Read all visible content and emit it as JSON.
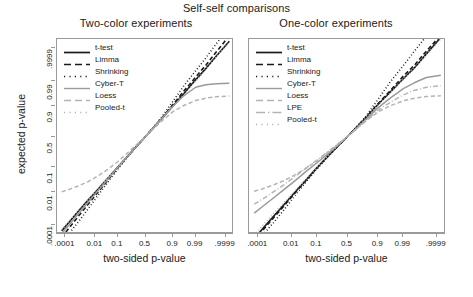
{
  "chart_data": {
    "type": "line",
    "title": "Self-self comparisons",
    "xlabel": "two-sided p-value",
    "ylabel": "expected p-value",
    "scale": "probit",
    "grid": false,
    "legend_position": "top-left inside panel",
    "xticks": [
      ".0001",
      "0.01",
      "0.1",
      "0.5",
      "0.9",
      "0.99",
      ".9999"
    ],
    "xtick_values": [
      0.0001,
      0.01,
      0.1,
      0.5,
      0.9,
      0.99,
      0.9999
    ],
    "yticks": [
      ".0001",
      "0.01",
      "0.1",
      "0.5",
      "0.9",
      "0.99",
      ".9999"
    ],
    "ytick_values": [
      0.0001,
      0.01,
      0.1,
      0.5,
      0.9,
      0.99,
      0.9999
    ],
    "xlim": [
      2e-05,
      0.99998
    ],
    "ylim": [
      2e-05,
      0.99998
    ],
    "panels": [
      {
        "name": "two-color",
        "title": "Two-color experiments",
        "series": [
          {
            "name": "t-test",
            "color": "#1a1a1a",
            "dash": "solid",
            "width": 1.6,
            "x": [
              5e-05,
              0.0002,
              0.001,
              0.004,
              0.012,
              0.04,
              0.1,
              0.22,
              0.35,
              0.5,
              0.65,
              0.78,
              0.9,
              0.96,
              0.99,
              0.9975,
              0.9995,
              0.99995
            ],
            "y": [
              3.5e-05,
              0.00016,
              0.0009,
              0.0038,
              0.0115,
              0.039,
              0.1,
              0.22,
              0.35,
              0.5,
              0.65,
              0.78,
              0.9,
              0.962,
              0.9915,
              0.99795,
              0.99965,
              0.99997
            ]
          },
          {
            "name": "Limma",
            "color": "#1a1a1a",
            "dash": "dashed",
            "width": 1.6,
            "x": [
              5e-05,
              0.0002,
              0.001,
              0.004,
              0.012,
              0.04,
              0.1,
              0.22,
              0.35,
              0.5,
              0.65,
              0.78,
              0.9,
              0.96,
              0.99,
              0.9975,
              0.9995,
              0.99995
            ],
            "y": [
              1.05e-05,
              6e-05,
              0.00043,
              0.0022,
              0.0082,
              0.033,
              0.094,
              0.218,
              0.35,
              0.5,
              0.653,
              0.787,
              0.912,
              0.97,
              0.9938,
              0.9987,
              0.99982,
              0.999989
            ]
          },
          {
            "name": "Shrinking",
            "color": "#1a1a1a",
            "dash": "dotted",
            "width": 1.6,
            "x": [
              5e-05,
              0.0002,
              0.001,
              0.004,
              0.012,
              0.04,
              0.1,
              0.22,
              0.35,
              0.5,
              0.65,
              0.78,
              0.9,
              0.96,
              0.99,
              0.9975,
              0.9995,
              0.99995
            ],
            "y": [
              3.5e-06,
              2.2e-05,
              0.00018,
              0.0012,
              0.0055,
              0.027,
              0.086,
              0.212,
              0.348,
              0.5,
              0.656,
              0.8,
              0.932,
              0.982,
              0.9972,
              0.99955,
              0.999955,
              0.9999975
            ]
          },
          {
            "name": "Cyber-T",
            "color": "#9a9a9a",
            "dash": "solid",
            "width": 1.5,
            "x": [
              5e-05,
              0.0002,
              0.001,
              0.004,
              0.012,
              0.04,
              0.1,
              0.22,
              0.35,
              0.5,
              0.65,
              0.78,
              0.9,
              0.96,
              0.99,
              0.9975,
              0.9995,
              0.99995
            ],
            "y": [
              2.1e-05,
              0.0001,
              0.00062,
              0.0029,
              0.0098,
              0.036,
              0.097,
              0.219,
              0.35,
              0.5,
              0.652,
              0.782,
              0.9,
              0.955,
              0.981,
              0.9855,
              0.987,
              0.9875
            ]
          },
          {
            "name": "Loess",
            "color": "#b4b4b4",
            "dash": "dashed",
            "width": 1.5,
            "x": [
              5e-05,
              0.0002,
              0.001,
              0.004,
              0.012,
              0.04,
              0.1,
              0.22,
              0.35,
              0.5,
              0.65,
              0.78,
              0.9,
              0.96,
              0.99,
              0.9975,
              0.9995,
              0.99995
            ],
            "y": [
              0.0098,
              0.013,
              0.019,
              0.029,
              0.046,
              0.083,
              0.145,
              0.262,
              0.375,
              0.5,
              0.632,
              0.748,
              0.853,
              0.902,
              0.935,
              0.947,
              0.953,
              0.956
            ]
          },
          {
            "name": "Pooled-t",
            "color": "#b4b4b4",
            "dash": "dotted",
            "width": 1.5,
            "x": [
              5e-05,
              0.0002,
              0.001,
              0.004,
              0.012,
              0.04,
              0.1,
              0.22,
              0.35,
              0.5,
              0.65,
              0.78,
              0.9,
              0.96,
              0.99,
              0.9975,
              0.9995,
              0.99995
            ],
            "y": [
              4.2e-05,
              0.00019,
              0.00098,
              0.0041,
              0.0125,
              0.042,
              0.104,
              0.224,
              0.352,
              0.5,
              0.648,
              0.776,
              0.897,
              0.959,
              0.99,
              0.99775,
              0.99962,
              0.999965
            ]
          }
        ]
      },
      {
        "name": "one-color",
        "title": "One-color experiments",
        "series": [
          {
            "name": "t-test",
            "color": "#1a1a1a",
            "dash": "solid",
            "width": 1.6,
            "x": [
              5e-05,
              0.0002,
              0.001,
              0.004,
              0.012,
              0.04,
              0.1,
              0.22,
              0.35,
              0.5,
              0.65,
              0.78,
              0.9,
              0.96,
              0.99,
              0.9975,
              0.9995,
              0.99995
            ],
            "y": [
              8.5e-06,
              5e-05,
              0.00038,
              0.002,
              0.0078,
              0.032,
              0.093,
              0.216,
              0.349,
              0.5,
              0.654,
              0.789,
              0.913,
              0.967,
              0.9925,
              0.9982,
              0.99975,
              0.999985
            ]
          },
          {
            "name": "Limma",
            "color": "#1a1a1a",
            "dash": "dashed",
            "width": 1.6,
            "x": [
              5e-05,
              0.0002,
              0.001,
              0.004,
              0.012,
              0.04,
              0.1,
              0.22,
              0.35,
              0.5,
              0.65,
              0.78,
              0.9,
              0.96,
              0.99,
              0.9975,
              0.9995,
              0.99995
            ],
            "y": [
              6.2e-06,
              3.8e-05,
              0.0003,
              0.0017,
              0.007,
              0.0305,
              0.091,
              0.215,
              0.348,
              0.5,
              0.655,
              0.792,
              0.918,
              0.971,
              0.9945,
              0.99875,
              0.99984,
              0.99999
            ]
          },
          {
            "name": "Shrinking",
            "color": "#1a1a1a",
            "dash": "dotted",
            "width": 1.6,
            "x": [
              5e-05,
              0.0002,
              0.001,
              0.004,
              0.012,
              0.04,
              0.1,
              0.22,
              0.35,
              0.5,
              0.65,
              0.78,
              0.9,
              0.96,
              0.99,
              0.9975,
              0.9995,
              0.99995
            ],
            "y": [
              2.5e-06,
              1.6e-05,
              0.00014,
              0.001,
              0.005,
              0.026,
              0.085,
              0.211,
              0.347,
              0.5,
              0.658,
              0.805,
              0.942,
              0.988,
              0.9986,
              0.99985,
              0.999988,
              0.9999995
            ]
          },
          {
            "name": "Cyber-T",
            "color": "#9a9a9a",
            "dash": "solid",
            "width": 1.5,
            "x": [
              5e-05,
              0.0002,
              0.001,
              0.004,
              0.012,
              0.04,
              0.1,
              0.22,
              0.35,
              0.5,
              0.65,
              0.78,
              0.9,
              0.96,
              0.99,
              0.9975,
              0.9995,
              0.99995
            ],
            "y": [
              0.00062,
              0.0016,
              0.0048,
              0.0125,
              0.0275,
              0.068,
              0.132,
              0.245,
              0.362,
              0.5,
              0.64,
              0.765,
              0.888,
              0.945,
              0.978,
              0.9885,
              0.9935,
              0.995
            ]
          },
          {
            "name": "Loess",
            "color": "#b4b4b4",
            "dash": "dashed",
            "width": 1.5,
            "x": [
              5e-05,
              0.0002,
              0.001,
              0.004,
              0.012,
              0.04,
              0.1,
              0.22,
              0.35,
              0.5,
              0.65,
              0.78,
              0.9,
              0.96,
              0.99,
              0.9975,
              0.9995,
              0.99995
            ],
            "y": [
              0.0105,
              0.0138,
              0.0205,
              0.0315,
              0.049,
              0.087,
              0.15,
              0.266,
              0.378,
              0.5,
              0.63,
              0.745,
              0.85,
              0.9,
              0.934,
              0.947,
              0.954,
              0.957
            ]
          },
          {
            "name": "LPE",
            "color": "#b4b4b4",
            "dash": "dashdot",
            "width": 1.5,
            "x": [
              5e-05,
              0.0002,
              0.001,
              0.004,
              0.012,
              0.04,
              0.1,
              0.22,
              0.35,
              0.5,
              0.65,
              0.78,
              0.9,
              0.96,
              0.99,
              0.9975,
              0.9995,
              0.99995
            ],
            "y": [
              0.0022,
              0.0042,
              0.0098,
              0.021,
              0.041,
              0.089,
              0.158,
              0.272,
              0.382,
              0.5,
              0.628,
              0.748,
              0.866,
              0.922,
              0.96,
              0.9745,
              0.981,
              0.984
            ]
          },
          {
            "name": "Pooled-t",
            "color": "#b4b4b4",
            "dash": "dotted",
            "width": 1.5,
            "x": [
              5e-05,
              0.0002,
              0.001,
              0.004,
              0.012,
              0.04,
              0.1,
              0.22,
              0.35,
              0.5,
              0.65,
              0.78,
              0.9,
              0.96,
              0.99,
              0.9975,
              0.9995,
              0.99995
            ],
            "y": [
              1.6e-05,
              9e-05,
              0.00058,
              0.0026,
              0.0092,
              0.035,
              0.096,
              0.218,
              0.35,
              0.5,
              0.653,
              0.786,
              0.909,
              0.965,
              0.9918,
              0.99805,
              0.99972,
              0.99998
            ]
          }
        ]
      }
    ]
  },
  "legend_left": {
    "items": [
      {
        "label": "t-test",
        "color": "#1a1a1a",
        "dash": "solid"
      },
      {
        "label": "Limma",
        "color": "#1a1a1a",
        "dash": "dashed"
      },
      {
        "label": "Shrinking",
        "color": "#1a1a1a",
        "dash": "dotted"
      },
      {
        "label": "Cyber-T",
        "color": "#9a9a9a",
        "dash": "solid"
      },
      {
        "label": "Loess",
        "color": "#b4b4b4",
        "dash": "dashed"
      },
      {
        "label": "Pooled-t",
        "color": "#b4b4b4",
        "dash": "dotted"
      }
    ]
  },
  "legend_right": {
    "items": [
      {
        "label": "t-test",
        "color": "#1a1a1a",
        "dash": "solid"
      },
      {
        "label": "Limma",
        "color": "#1a1a1a",
        "dash": "dashed"
      },
      {
        "label": "Shrinking",
        "color": "#1a1a1a",
        "dash": "dotted"
      },
      {
        "label": "Cyber-T",
        "color": "#9a9a9a",
        "dash": "solid"
      },
      {
        "label": "Loess",
        "color": "#b4b4b4",
        "dash": "dashed"
      },
      {
        "label": "LPE",
        "color": "#b4b4b4",
        "dash": "dashdot"
      },
      {
        "label": "Pooled-t",
        "color": "#b4b4b4",
        "dash": "dotted"
      }
    ]
  }
}
